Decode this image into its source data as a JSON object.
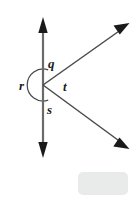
{
  "figure": {
    "stroke_color": "#4a4a4a",
    "arrow_fill": "#1a1a1a",
    "label_color": "#1a1a1a",
    "background_color": "#ffffff",
    "center_point": {
      "x": 43,
      "y": 85
    },
    "lines": [
      {
        "name": "vertical-line",
        "from": {
          "x": 43,
          "y": 20
        },
        "to": {
          "x": 43,
          "y": 153
        },
        "arrowheads": "both"
      },
      {
        "name": "upper-right-ray",
        "from": {
          "x": 43,
          "y": 85
        },
        "to": {
          "x": 128,
          "y": 25
        },
        "arrowheads": "end"
      },
      {
        "name": "lower-right-ray",
        "from": {
          "x": 43,
          "y": 85
        },
        "to": {
          "x": 128,
          "y": 148
        },
        "arrowheads": "end"
      }
    ],
    "arc": {
      "name": "reflex-angle-arc",
      "center": {
        "x": 43,
        "y": 85
      },
      "radius": 16,
      "description": "near-complete circle marking the reflex angle r"
    },
    "labels": [
      {
        "id": "q",
        "text": "q",
        "x": 48,
        "y": 68
      },
      {
        "id": "r",
        "text": "r",
        "x": 20,
        "y": 90
      },
      {
        "id": "t",
        "text": "t",
        "x": 63,
        "y": 91
      },
      {
        "id": "s",
        "text": "s",
        "x": 47,
        "y": 113
      }
    ],
    "gray_box": {
      "name": "gray-placeholder-box",
      "x": 78,
      "y": 172,
      "width": 50,
      "height": 23,
      "color": "#e9eaea"
    }
  }
}
